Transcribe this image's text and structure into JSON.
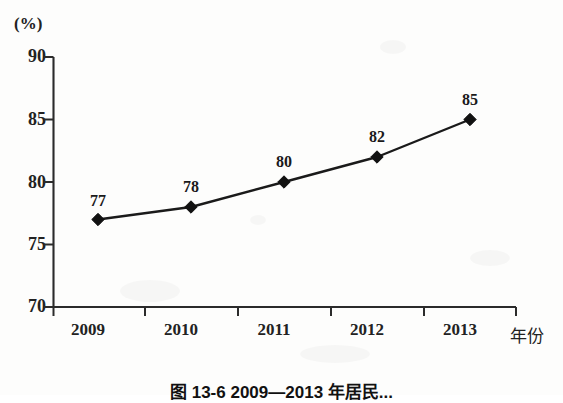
{
  "chart_data": {
    "type": "line",
    "title": "",
    "subtitle": "",
    "xlabel": "年份",
    "ylabel": "(%)",
    "categories": [
      "2009",
      "2010",
      "2011",
      "2012",
      "2013"
    ],
    "values": [
      77,
      78,
      80,
      82,
      85
    ],
    "point_labels": [
      "77",
      "78",
      "80",
      "82",
      "85"
    ],
    "series": [
      {
        "name": "",
        "values": [
          77,
          78,
          80,
          82,
          85
        ],
        "marker": "diamond",
        "color": "#1a1a1a"
      }
    ],
    "ylim": [
      70,
      90
    ],
    "yticks": [
      70,
      75,
      80,
      85,
      90
    ],
    "ytick_labels": [
      "70",
      "75",
      "80",
      "85",
      "90"
    ],
    "xtick_labels": [
      "2009",
      "2010",
      "2011",
      "2012",
      "2013"
    ],
    "grid": false,
    "legend": false,
    "legend_position": "none",
    "axis_color": "#2a2a2a",
    "line_color": "#1a1a1a",
    "marker_color": "#111111",
    "background": "#fdfdfc"
  },
  "figure": {
    "caption": "图 13-6  2009—2013 年居民..."
  }
}
